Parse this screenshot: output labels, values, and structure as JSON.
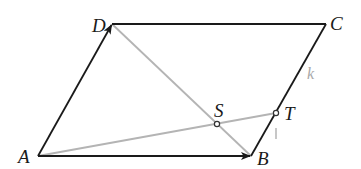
{
  "diagram": {
    "type": "geometry",
    "colors": {
      "edge": "#1a1a1a",
      "auxiliary": "#b4b4b4",
      "label": "#1a1a1a",
      "faint_label": "#a8a8a8",
      "background": "#ffffff"
    },
    "points": {
      "A": {
        "label": "A",
        "x": 38,
        "y": 156
      },
      "B": {
        "label": "B",
        "x": 251,
        "y": 156
      },
      "C": {
        "label": "C",
        "x": 326,
        "y": 24
      },
      "D": {
        "label": "D",
        "x": 112,
        "y": 24
      },
      "S": {
        "label": "S",
        "x": 217,
        "y": 124
      },
      "T": {
        "label": "T",
        "x": 276,
        "y": 113
      }
    },
    "segments": [
      {
        "name": "AB",
        "from": "A",
        "to": "B",
        "style": "solid-dark",
        "arrow": true
      },
      {
        "name": "AD",
        "from": "A",
        "to": "D",
        "style": "solid-dark",
        "arrow": true
      },
      {
        "name": "DC",
        "from": "D",
        "to": "C",
        "style": "solid-dark",
        "arrow": false
      },
      {
        "name": "CB",
        "from": "C",
        "to": "B",
        "style": "solid-dark",
        "arrow": false
      },
      {
        "name": "DB",
        "from": "D",
        "to": "B",
        "style": "gray",
        "arrow": false
      },
      {
        "name": "AT",
        "from": "A",
        "to": "T",
        "style": "gray",
        "arrow": false
      }
    ],
    "marked_points": [
      "S",
      "T"
    ],
    "annotations": {
      "k": "k",
      "l": "l"
    }
  }
}
